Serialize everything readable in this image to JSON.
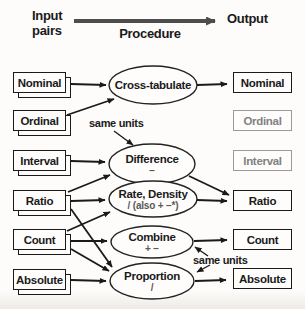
{
  "header": {
    "input_label": "Input pairs",
    "procedure_label": "Procedure",
    "output_label": "Output"
  },
  "inputs": [
    {
      "label": "Nominal"
    },
    {
      "label": "Ordinal"
    },
    {
      "label": "Interval"
    },
    {
      "label": "Ratio"
    },
    {
      "label": "Count"
    },
    {
      "label": "Absolute"
    }
  ],
  "procedures": [
    {
      "title": "Cross-tabulate",
      "sub": ""
    },
    {
      "title": "Difference",
      "sub": "−"
    },
    {
      "title": "Rate, Density",
      "sub": "/ (also + −*)"
    },
    {
      "title": "Combine",
      "sub": "+ −"
    },
    {
      "title": "Proportion",
      "sub": "/"
    }
  ],
  "outputs": [
    {
      "label": "Nominal",
      "state": "active"
    },
    {
      "label": "Ordinal",
      "state": "muted"
    },
    {
      "label": "Interval",
      "state": "muted"
    },
    {
      "label": "Ratio",
      "state": "active"
    },
    {
      "label": "Count",
      "state": "active"
    },
    {
      "label": "Absolute",
      "state": "active"
    }
  ],
  "annotations": {
    "same_units_top": "same units",
    "same_units_bottom": "same units",
    "same_units_top_applies_to": [
      "Difference"
    ],
    "same_units_bottom_applies_to": [
      "Combine",
      "Proportion"
    ]
  },
  "connections": [
    {
      "from": "Nominal",
      "to": "Cross-tabulate"
    },
    {
      "from": "Ordinal",
      "to": "Cross-tabulate"
    },
    {
      "from": "Interval",
      "to": "Difference"
    },
    {
      "from": "Ratio",
      "to": "Difference"
    },
    {
      "from": "Ratio",
      "to": "Rate, Density"
    },
    {
      "from": "Ratio",
      "to": "Proportion"
    },
    {
      "from": "Count",
      "to": "Rate, Density"
    },
    {
      "from": "Count",
      "to": "Combine"
    },
    {
      "from": "Count",
      "to": "Proportion"
    },
    {
      "from": "Absolute",
      "to": "Proportion"
    },
    {
      "from": "Cross-tabulate",
      "to": "Nominal output"
    },
    {
      "from": "Difference",
      "to": "Ratio output"
    },
    {
      "from": "Rate, Density",
      "to": "Ratio output"
    },
    {
      "from": "Combine",
      "to": "Count output"
    },
    {
      "from": "Proportion",
      "to": "Absolute output"
    }
  ],
  "colors": {
    "ink": "#1a1a1a",
    "muted_border": "#9a9a9a",
    "muted_text": "#818181",
    "header_arrow": "#4d4d4d",
    "background": "#fdfcfa"
  }
}
